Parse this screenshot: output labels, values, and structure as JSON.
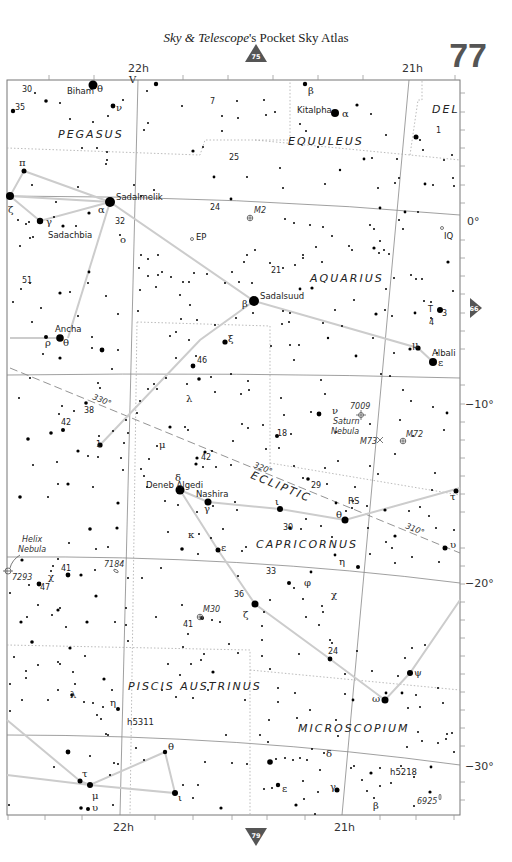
{
  "header": {
    "title_italic": "Sky & Telescope",
    "title_rest": "'s Pocket Sky Atlas",
    "page_number": "77"
  },
  "nav": {
    "up_page": "75",
    "right_page": "66",
    "down_page": "79"
  },
  "axes": {
    "ra_top": [
      "22h",
      "21h"
    ],
    "ra_bottom": [
      "22h",
      "21h"
    ],
    "dec": [
      "0°",
      "−10°",
      "−20°",
      "−30°"
    ]
  },
  "constellations": [
    "PEGASUS",
    "EQUULEUS",
    "DEL",
    "AQUARIUS",
    "CAPRICORNUS",
    "PISCIS AUSTRINUS",
    "MICROSCOPIUM"
  ],
  "star_names": [
    "Biham",
    "Kitalpha",
    "Sadalmelik",
    "Sadachbia",
    "Sadalsuud",
    "Ancha",
    "Albali",
    "Deneb Algedi",
    "Nashira"
  ],
  "dso": {
    "m2": "M2",
    "ep": "EP",
    "iq": "IQ",
    "n7009": "7009",
    "saturn1": "Saturn",
    "saturn2": "Nebula",
    "m73": "M73",
    "m72": "M72",
    "helix1": "Helix",
    "helix2": "Nebula",
    "n7293": "7293",
    "n7184": "7184",
    "m30": "M30",
    "h5311": "h5311",
    "h5218": "h5218",
    "n6925": "6925",
    "rs": "RS",
    "tx": "T"
  },
  "ecliptic": {
    "label": "ECLIPTIC",
    "marks": [
      "330°",
      "320°",
      "310°"
    ]
  }
}
